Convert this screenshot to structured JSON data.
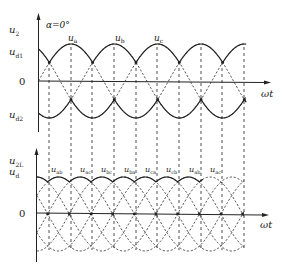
{
  "top_plot": {
    "y_axis_label": "u",
    "y_axis_sub": "2",
    "alpha_label": "α=0°",
    "upper_envelope_label": "u",
    "upper_envelope_sub": "d1",
    "zero_label": "0",
    "lower_envelope_label": "u",
    "lower_envelope_sub": "d2",
    "x_axis_label": "ωt",
    "phase_labels": [
      {
        "base": "u",
        "sub": "a"
      },
      {
        "base": "u",
        "sub": "b"
      },
      {
        "base": "u",
        "sub": "c"
      }
    ]
  },
  "bottom_plot": {
    "y_axis_label_1": "u",
    "y_axis_label_1_sub": "2L",
    "y_axis_label_2": "u",
    "y_axis_label_2_sub": "d",
    "zero_label": "0",
    "x_axis_label": "ωt",
    "line_labels": [
      {
        "base": "u",
        "sub": "ab"
      },
      {
        "base": "u",
        "sub": "ac"
      },
      {
        "base": "u",
        "sub": "bc"
      },
      {
        "base": "u",
        "sub": "ba"
      },
      {
        "base": "u",
        "sub": "ca"
      },
      {
        "base": "u",
        "sub": "cb"
      },
      {
        "base": "u",
        "sub": "ab"
      },
      {
        "base": "u",
        "sub": "ac"
      }
    ]
  },
  "colors": {
    "line": "#222222",
    "background": "#ffffff"
  }
}
